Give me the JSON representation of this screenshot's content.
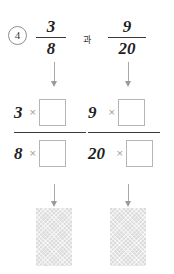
{
  "worksheet": {
    "problem_number": "4",
    "conjunction": "과",
    "given_fractions": [
      {
        "numerator": "3",
        "denominator": "8"
      },
      {
        "numerator": "9",
        "denominator": "20"
      }
    ],
    "multiply_symbol": "×",
    "columns": [
      {
        "id": "left",
        "numerator_operand": "3",
        "denominator_operand": "8",
        "numerator_box_value": "",
        "denominator_box_value": "",
        "result_value": ""
      },
      {
        "id": "right",
        "numerator_operand": "9",
        "denominator_operand": "20",
        "numerator_box_value": "",
        "denominator_box_value": "",
        "result_value": ""
      }
    ],
    "colors": {
      "ink": "#1f1f1f",
      "rule": "#3a3a3a",
      "box_border": "#b5b5b5",
      "arrow": "#9a9a9a",
      "shaded_fill": "#dcdcdc",
      "times_symbol": "#9b9b9b"
    }
  }
}
